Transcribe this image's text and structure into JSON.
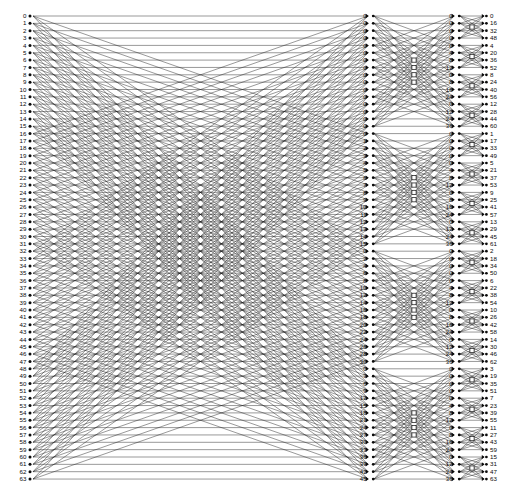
{
  "diagram": {
    "type": "signal-flow-graph",
    "n_points": 64,
    "radix": 4,
    "stages": 3,
    "colors": {
      "background": "#ffffff",
      "line": "#141414",
      "node": "#0a0a0a",
      "text": "#0a0a0a"
    }
  },
  "columns": {
    "input": {
      "name": "input-column",
      "count": 64,
      "labels": [
        "0",
        "1",
        "2",
        "3",
        "4",
        "5",
        "6",
        "7",
        "8",
        "9",
        "10",
        "11",
        "12",
        "13",
        "14",
        "15",
        "16",
        "17",
        "18",
        "19",
        "20",
        "21",
        "22",
        "23",
        "24",
        "25",
        "26",
        "27",
        "28",
        "29",
        "30",
        "31",
        "32",
        "33",
        "34",
        "35",
        "36",
        "37",
        "38",
        "39",
        "40",
        "41",
        "42",
        "43",
        "44",
        "45",
        "46",
        "47",
        "48",
        "49",
        "50",
        "51",
        "52",
        "53",
        "54",
        "55",
        "56",
        "57",
        "58",
        "59",
        "60",
        "61",
        "62",
        "63"
      ]
    },
    "stage2_twiddle": {
      "name": "stage2-twiddle-column",
      "count": 64,
      "description": "Twiddle factor exponents entering stage 2, four blocks of 16",
      "blocks": [
        {
          "block": 0,
          "step": 0,
          "labels": [
            "0",
            "0",
            "0",
            "0",
            "0",
            "0",
            "0",
            "0",
            "0",
            "0",
            "0",
            "0",
            "0",
            "0",
            "0",
            "0"
          ]
        },
        {
          "block": 1,
          "step": 1,
          "labels": [
            "0",
            "1",
            "2",
            "3",
            "4",
            "5",
            "6",
            "7",
            "8",
            "9",
            "10",
            "11",
            "12",
            "13",
            "14",
            "15"
          ]
        },
        {
          "block": 2,
          "step": 2,
          "labels": [
            "0",
            "2",
            "4",
            "6",
            "8",
            "10",
            "12",
            "14",
            "16",
            "18",
            "20",
            "22",
            "24",
            "26",
            "28",
            "30"
          ]
        },
        {
          "block": 3,
          "step": 3,
          "labels": [
            "0",
            "3",
            "6",
            "9",
            "12",
            "15",
            "18",
            "21",
            "24",
            "27",
            "30",
            "33",
            "36",
            "39",
            "42",
            "45"
          ]
        }
      ]
    },
    "stage3_twiddle": {
      "name": "stage3-twiddle-column",
      "count": 64,
      "description": "Twiddle factor exponents entering stage 3, sixteen groups of 4",
      "groups": [
        {
          "step": 0,
          "labels": [
            "0",
            "0",
            "0",
            "0"
          ]
        },
        {
          "step": 4,
          "labels": [
            "0",
            "4",
            "8",
            "12"
          ]
        },
        {
          "step": 8,
          "labels": [
            "0",
            "8",
            "16",
            "24"
          ]
        },
        {
          "step": 12,
          "labels": [
            "0",
            "12",
            "24",
            "36"
          ]
        },
        {
          "step": 0,
          "labels": [
            "0",
            "0",
            "0",
            "0"
          ]
        },
        {
          "step": 4,
          "labels": [
            "0",
            "4",
            "8",
            "12"
          ]
        },
        {
          "step": 8,
          "labels": [
            "0",
            "8",
            "16",
            "24"
          ]
        },
        {
          "step": 12,
          "labels": [
            "0",
            "12",
            "24",
            "36"
          ]
        },
        {
          "step": 0,
          "labels": [
            "0",
            "0",
            "0",
            "0"
          ]
        },
        {
          "step": 4,
          "labels": [
            "0",
            "4",
            "8",
            "12"
          ]
        },
        {
          "step": 8,
          "labels": [
            "0",
            "8",
            "16",
            "24"
          ]
        },
        {
          "step": 12,
          "labels": [
            "0",
            "12",
            "24",
            "36"
          ]
        },
        {
          "step": 0,
          "labels": [
            "0",
            "0",
            "0",
            "0"
          ]
        },
        {
          "step": 4,
          "labels": [
            "0",
            "4",
            "8",
            "12"
          ]
        },
        {
          "step": 8,
          "labels": [
            "0",
            "8",
            "16",
            "24"
          ]
        },
        {
          "step": 12,
          "labels": [
            "0",
            "12",
            "24",
            "36"
          ]
        }
      ]
    },
    "output": {
      "name": "output-column",
      "count": 64,
      "description": "Digit-reversed (radix-4) output index order",
      "labels": [
        "0",
        "16",
        "32",
        "48",
        "4",
        "20",
        "36",
        "52",
        "8",
        "24",
        "40",
        "56",
        "12",
        "28",
        "44",
        "60",
        "1",
        "17",
        "33",
        "49",
        "5",
        "21",
        "37",
        "53",
        "9",
        "25",
        "41",
        "57",
        "13",
        "29",
        "45",
        "61",
        "2",
        "18",
        "34",
        "50",
        "6",
        "22",
        "38",
        "54",
        "10",
        "26",
        "42",
        "58",
        "14",
        "30",
        "46",
        "62",
        "3",
        "19",
        "35",
        "51",
        "7",
        "23",
        "39",
        "55",
        "11",
        "27",
        "43",
        "59",
        "15",
        "31",
        "47",
        "63"
      ]
    }
  },
  "geometry": {
    "x_input": 30,
    "x_stage2": 372,
    "x_stage3": 458,
    "x_output": 487,
    "y_top": 16,
    "y_step": 7.35
  }
}
